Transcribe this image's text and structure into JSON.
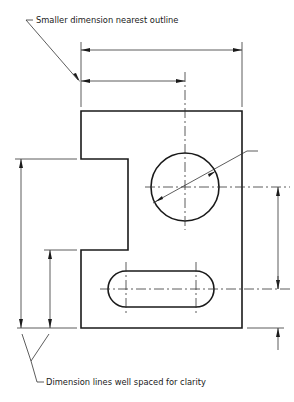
{
  "figure": {
    "type": "engineering-drawing",
    "annotations": [
      {
        "id": "top-note",
        "text": "Smaller dimension nearest outline"
      },
      {
        "id": "bottom-note",
        "text": "Dimension lines well spaced for clarity"
      }
    ],
    "part": {
      "outline": "Rectangular plate with rectangular notch on left side",
      "features": [
        "circular hole (diameter dimension)",
        "slotted hole with rounded ends"
      ]
    },
    "dimensions": {
      "horizontal": [
        "overall width",
        "hole center from left edge"
      ],
      "vertical_left": [
        "overall height below notch",
        "notch bottom height"
      ],
      "vertical_right": [
        "hole center to slot center",
        "slot center to bottom edge"
      ],
      "diameter": "circular hole diameter leader"
    },
    "colors": {
      "line": "#1a1a1a",
      "background": "#ffffff"
    }
  }
}
